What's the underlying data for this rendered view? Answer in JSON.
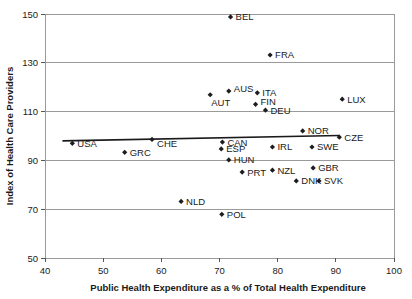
{
  "chart_data": {
    "type": "scatter",
    "title": "",
    "xlabel": "Public Health Expenditure as a % of Total Health Expenditure",
    "ylabel": "Index of Health Care Providers",
    "xlim": [
      40,
      100
    ],
    "ylim": [
      50,
      150
    ],
    "xticks": [
      40,
      50,
      60,
      70,
      80,
      90,
      100
    ],
    "yticks": [
      50,
      70,
      90,
      110,
      130,
      150
    ],
    "grid": true,
    "legend": "none",
    "points": [
      {
        "label": "USA",
        "x": 44.7,
        "y": 97.0,
        "label_pos": "right"
      },
      {
        "label": "GRC",
        "x": 53.7,
        "y": 93.3,
        "label_pos": "right"
      },
      {
        "label": "CHE",
        "x": 58.4,
        "y": 98.6,
        "label_pos": "right-below"
      },
      {
        "label": "NLD",
        "x": 63.4,
        "y": 73.2,
        "label_pos": "right"
      },
      {
        "label": "AUT",
        "x": 68.4,
        "y": 116.9,
        "label_pos": "below-right"
      },
      {
        "label": "ESP",
        "x": 70.3,
        "y": 94.7,
        "label_pos": "right"
      },
      {
        "label": "CAN",
        "x": 70.5,
        "y": 97.5,
        "label_pos": "right"
      },
      {
        "label": "POL",
        "x": 70.4,
        "y": 67.9,
        "label_pos": "right"
      },
      {
        "label": "HUN",
        "x": 71.6,
        "y": 90.2,
        "label_pos": "right"
      },
      {
        "label": "AUS",
        "x": 71.6,
        "y": 118.4,
        "label_pos": "right-above"
      },
      {
        "label": "BEL",
        "x": 71.9,
        "y": 148.8,
        "label_pos": "right"
      },
      {
        "label": "PRT",
        "x": 73.9,
        "y": 85.2,
        "label_pos": "right"
      },
      {
        "label": "FIN",
        "x": 76.2,
        "y": 113.0,
        "label_pos": "right-above"
      },
      {
        "label": "ITA",
        "x": 76.5,
        "y": 117.7,
        "label_pos": "right"
      },
      {
        "label": "DEU",
        "x": 77.9,
        "y": 110.6,
        "label_pos": "right"
      },
      {
        "label": "FRA",
        "x": 78.7,
        "y": 133.2,
        "label_pos": "right"
      },
      {
        "label": "IRL",
        "x": 79.1,
        "y": 95.5,
        "label_pos": "right"
      },
      {
        "label": "NZL",
        "x": 79.1,
        "y": 86.0,
        "label_pos": "right"
      },
      {
        "label": "DNK",
        "x": 83.2,
        "y": 81.6,
        "label_pos": "right"
      },
      {
        "label": "NOR",
        "x": 84.3,
        "y": 102.1,
        "label_pos": "right"
      },
      {
        "label": "SVK",
        "x": 87.1,
        "y": 81.6,
        "label_pos": "right"
      },
      {
        "label": "GBR",
        "x": 86.1,
        "y": 86.9,
        "label_pos": "right"
      },
      {
        "label": "SWE",
        "x": 85.9,
        "y": 95.5,
        "label_pos": "right"
      },
      {
        "label": "CZE",
        "x": 90.6,
        "y": 99.5,
        "label_pos": "right"
      },
      {
        "label": "LUX",
        "x": 91.1,
        "y": 115.1,
        "label_pos": "right"
      }
    ],
    "trendline": {
      "x_start": 43.0,
      "y_start": 98.0,
      "x_end": 90.6,
      "y_end": 100.2
    }
  }
}
